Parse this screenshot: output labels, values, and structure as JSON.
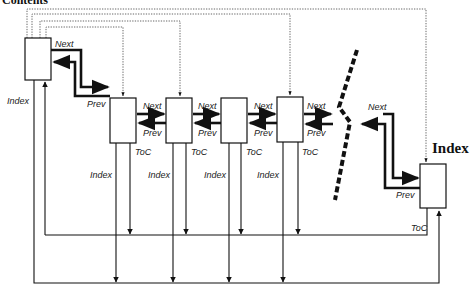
{
  "title": "Contents",
  "right_heading": "Index",
  "colors": {
    "line": "#111111",
    "dotted": "#555555",
    "background": "#ffffff"
  },
  "labels": {
    "next": "Next",
    "prev": "Prev",
    "toc": "ToC",
    "index": "Index"
  },
  "nodes": [
    {
      "id": "contents-block",
      "role": "contents",
      "x": 25,
      "y": 38,
      "w": 26,
      "h": 42
    },
    {
      "id": "page-1",
      "role": "page",
      "x": 110,
      "y": 98,
      "w": 26,
      "h": 45
    },
    {
      "id": "page-2",
      "role": "page",
      "x": 166,
      "y": 98,
      "w": 26,
      "h": 45
    },
    {
      "id": "page-3",
      "role": "page",
      "x": 221,
      "y": 98,
      "w": 26,
      "h": 45
    },
    {
      "id": "page-4",
      "role": "page",
      "x": 277,
      "y": 97,
      "w": 26,
      "h": 45
    },
    {
      "id": "index-block",
      "role": "index",
      "x": 420,
      "y": 164,
      "w": 26,
      "h": 44
    }
  ],
  "edges": [
    {
      "from": "contents-block",
      "to": "page-1",
      "type": "next"
    },
    {
      "from": "page-1",
      "to": "contents-block",
      "type": "prev"
    },
    {
      "from": "page-1",
      "to": "page-2",
      "type": "next"
    },
    {
      "from": "page-2",
      "to": "page-1",
      "type": "prev"
    },
    {
      "from": "page-2",
      "to": "page-3",
      "type": "next"
    },
    {
      "from": "page-3",
      "to": "page-2",
      "type": "prev"
    },
    {
      "from": "page-3",
      "to": "page-4",
      "type": "next"
    },
    {
      "from": "page-4",
      "to": "page-3",
      "type": "prev"
    },
    {
      "from": "index-block",
      "to": "contents-block",
      "type": "toc"
    },
    {
      "from": "contents-block",
      "to": "index-block",
      "type": "index"
    },
    {
      "from": "contents-block",
      "to": "page-1",
      "type": "dotted"
    },
    {
      "from": "contents-block",
      "to": "page-2",
      "type": "dotted"
    },
    {
      "from": "contents-block",
      "to": "page-4",
      "type": "dotted"
    },
    {
      "from": "contents-block",
      "to": "index-block",
      "type": "dotted"
    }
  ]
}
